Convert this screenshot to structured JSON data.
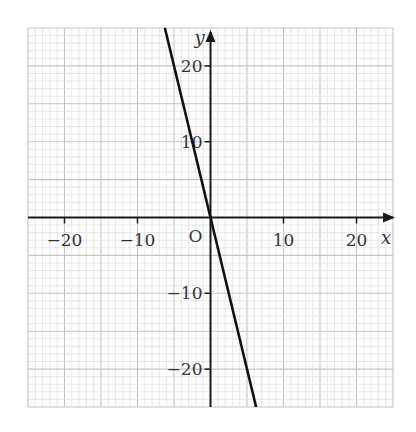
{
  "chart_data": {
    "type": "line",
    "title": "",
    "xlabel": "x",
    "ylabel": "y",
    "origin_label": "O",
    "xlim": [
      -25,
      25
    ],
    "ylim": [
      -25,
      25
    ],
    "grid": true,
    "grid_minor_step": 1,
    "grid_major_step": 5,
    "x_ticks": [
      -20,
      -10,
      10,
      20
    ],
    "x_tick_labels": [
      "−20",
      "−10",
      "10",
      "20"
    ],
    "y_ticks": [
      20,
      10,
      -10,
      -20
    ],
    "y_tick_labels": [
      "20",
      "10",
      "−10",
      "−20"
    ],
    "series": [
      {
        "name": "y = -4x",
        "equation": "y = -4x",
        "x": [
          -6.25,
          0,
          6.25
        ],
        "y": [
          25,
          0,
          -25
        ],
        "color": "#111111"
      }
    ],
    "legend": null
  },
  "colors": {
    "grid_minor": "#dcdcdc",
    "grid_major": "#c4c4c4",
    "axis": "#1a1a1a",
    "line": "#111111"
  }
}
